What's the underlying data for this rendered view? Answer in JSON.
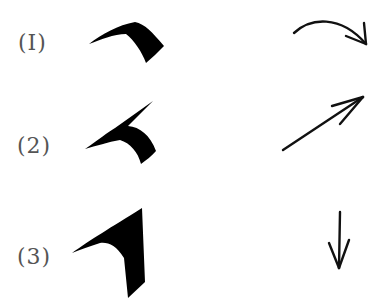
{
  "rows": [
    {
      "label": "(I)",
      "stroke": "curved-top-stroke",
      "direction": "curved-right-arrow"
    },
    {
      "label": "(2)",
      "stroke": "upward-hook-stroke",
      "direction": "diagonal-up-right-arrow"
    },
    {
      "label": "(3)",
      "stroke": "angled-vertical-stroke",
      "direction": "down-arrow"
    }
  ],
  "colors": {
    "ink": "#000000",
    "label": "#555555",
    "background": "#ffffff"
  }
}
